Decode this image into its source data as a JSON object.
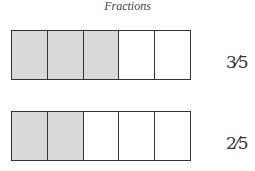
{
  "title": "Fractions",
  "colors": {
    "shaded": "#d9d9d9",
    "unshaded": "#ffffff",
    "border": "#333333"
  },
  "bars": [
    {
      "total_parts": 5,
      "shaded_parts": 3,
      "label": "3⁄5"
    },
    {
      "total_parts": 5,
      "shaded_parts": 2,
      "label": "2⁄5"
    }
  ]
}
